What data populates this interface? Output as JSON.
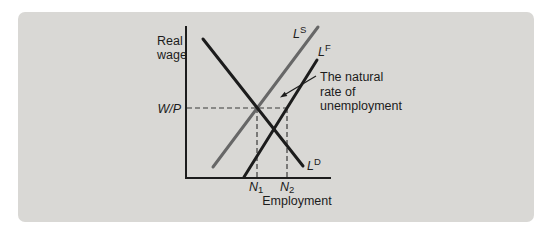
{
  "figure": {
    "page_background": "#ffffff",
    "panel_background": "#d9d8d5",
    "ink_color": "#1c1c1c",
    "supply_curve_color": "#676767",
    "y_axis_label_line1": "Real",
    "y_axis_label_line2": "wage",
    "x_axis_label": "Employment",
    "real_wage_label": "W/P",
    "curve_labels": {
      "supply_base": "L",
      "supply_sup": "S",
      "force_base": "L",
      "force_sup": "F",
      "demand_base": "L",
      "demand_sup": "D"
    },
    "employment_markers": {
      "n1_base": "N",
      "n1_sub": "1",
      "n2_base": "N",
      "n2_sub": "2"
    },
    "annotation": {
      "line1": "The natural",
      "line2": "rate of",
      "line3": "unemployment"
    }
  }
}
